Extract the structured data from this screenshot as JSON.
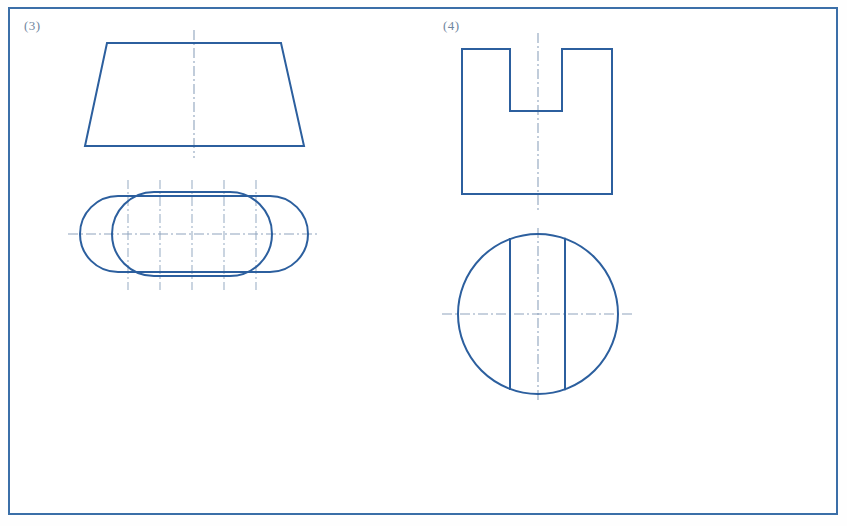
{
  "page": {
    "width": 847,
    "height": 526,
    "background_color": "#ffffff",
    "frame_color": "#3b6fa8",
    "line_color": "#2c5f9e",
    "centerline_color": "#8fa4bd",
    "label_color": "#6f86a0"
  },
  "exercises": [
    {
      "id": "exercise-3",
      "label": "(3)",
      "front_view": {
        "shape": "trapezoid",
        "top_left_x": 107,
        "top_right_x": 281,
        "bottom_left_x": 85,
        "bottom_right_x": 304,
        "top_y": 43,
        "bottom_y": 146,
        "has_vertical_centerline": true,
        "centerline_x": 194,
        "centerline_top_y": 30,
        "centerline_bottom_y": 158
      },
      "top_view": {
        "shape": "two-overlapping-stadiums",
        "outer_stadium": {
          "left_x": 80,
          "right_x": 308,
          "top_y": 196,
          "bottom_y": 272,
          "corner_radius": 38
        },
        "inner_stadium": {
          "left_x": 112,
          "right_x": 272,
          "top_y": 192,
          "bottom_y": 276,
          "corner_radius": 42
        },
        "horizontal_centerline": {
          "y": 234,
          "left_x": 68,
          "right_x": 318
        },
        "vertical_projection_lines_x": [
          128,
          160,
          192,
          224,
          256
        ],
        "projection_top_y": 180,
        "projection_bottom_y": 290
      }
    },
    {
      "id": "exercise-4",
      "label": "(4)",
      "front_view": {
        "shape": "notched-rectangle",
        "left_x": 462,
        "right_x": 612,
        "top_y": 49,
        "bottom_y": 194,
        "notch_left_x": 510,
        "notch_right_x": 562,
        "notch_bottom_y": 111,
        "has_vertical_centerline": true,
        "centerline_x": 538,
        "centerline_top_y": 33,
        "centerline_bottom_y": 212
      },
      "top_view": {
        "shape": "circle-with-two-chords",
        "center_x": 538,
        "center_y": 314,
        "radius": 80,
        "chord_lines_x": [
          510,
          565
        ],
        "horizontal_centerline": {
          "y": 314,
          "left_x": 442,
          "right_x": 632
        },
        "vertical_centerline": {
          "x": 538,
          "top_y": 228,
          "bottom_y": 402
        }
      }
    }
  ]
}
